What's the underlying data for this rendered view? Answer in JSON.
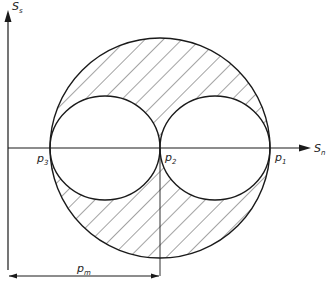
{
  "diagram": {
    "type": "mohr-circle",
    "axes": {
      "vertical_label": "S",
      "vertical_subscript": "s",
      "horizontal_label": "S",
      "horizontal_subscript": "n"
    },
    "points": [
      {
        "id": "p3",
        "label": "p",
        "subscript": "3"
      },
      {
        "id": "p2",
        "label": "p",
        "subscript": "2"
      },
      {
        "id": "p1",
        "label": "p",
        "subscript": "1"
      }
    ],
    "dimension": {
      "label": "p",
      "subscript": "m"
    },
    "colors": {
      "line": "#1a1a1a",
      "hatch": "#333333",
      "background": "#ffffff"
    }
  }
}
